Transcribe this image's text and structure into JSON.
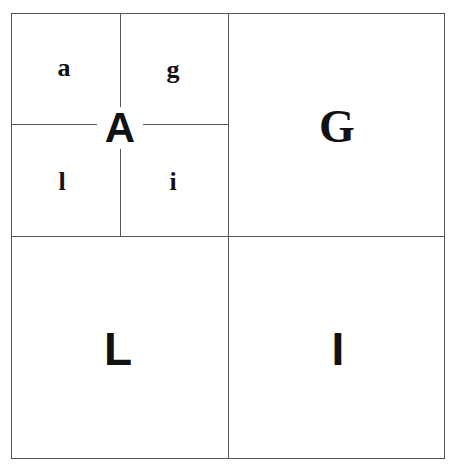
{
  "diagram": {
    "quadrants": [
      {
        "id": "A",
        "label": "A",
        "sub_quadrants": [
          {
            "label": "a"
          },
          {
            "label": "g"
          },
          {
            "label": "l"
          },
          {
            "label": "i"
          }
        ]
      },
      {
        "id": "G",
        "label": "G"
      },
      {
        "id": "L",
        "label": "L"
      },
      {
        "id": "I",
        "label": "I"
      }
    ]
  }
}
